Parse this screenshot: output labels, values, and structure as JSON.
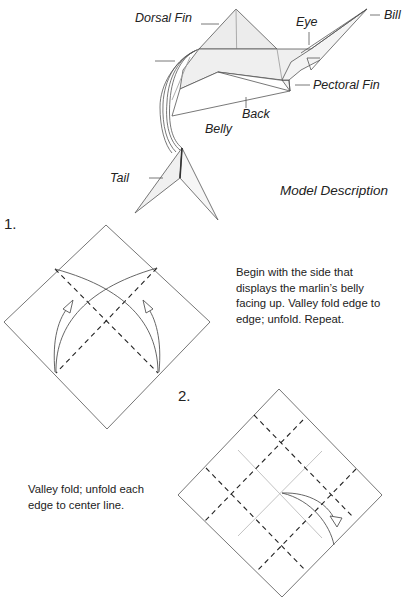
{
  "model": {
    "caption": "Model Description",
    "labels": {
      "dorsal_fin": "Dorsal Fin",
      "eye": "Eye",
      "bill": "Bill",
      "pectoral_fin": "Pectoral Fin",
      "back": "Back",
      "belly": "Belly",
      "tail": "Tail"
    }
  },
  "steps": [
    {
      "number": "1.",
      "text_lines": [
        "Begin with the side that",
        "displays the marlin’s belly",
        "facing up. Valley fold edge to",
        "edge; unfold. Repeat."
      ]
    },
    {
      "number": "2.",
      "text_lines": [
        "Valley fold; unfold each",
        "edge to center line."
      ]
    }
  ],
  "colors": {
    "line": "#555555",
    "fill": "#eeeeee",
    "dash": "#222222",
    "crease": "#bbbbbb",
    "text": "#222222"
  }
}
